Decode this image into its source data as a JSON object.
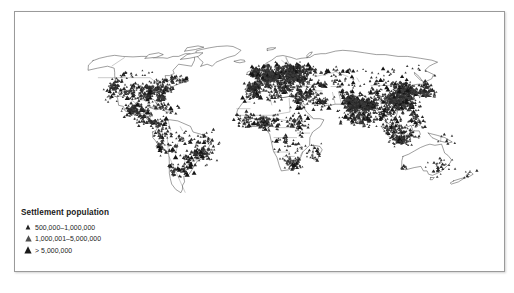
{
  "figure": {
    "background_color": "#ffffff",
    "border_color": "#9a9a9a",
    "land_outline_color": "#1a1a1a",
    "marker_color": "#222222"
  },
  "map": {
    "name": "world-settlement-population-map",
    "projection": "robinson",
    "land_fill": "#ffffff",
    "graticule": false
  },
  "legend": {
    "title": "Settlement population",
    "items": [
      {
        "label": "500,000–1,000,000",
        "marker": "triangle-small",
        "size": 3.0
      },
      {
        "label": "1,000,001–5,000,000",
        "marker": "triangle-medium",
        "size": 4.1
      },
      {
        "label": "> 5,000,000",
        "marker": "triangle-large",
        "size": 5.2
      }
    ]
  },
  "chart_data": {
    "type": "scatter",
    "title": "Settlement population",
    "xlabel": "",
    "ylabel": "",
    "grid": false,
    "legend_position": "bottom-left",
    "categories": [
      "500,000–1,000,000",
      "1,000,001–5,000,000",
      "> 5,000,000"
    ],
    "region_density": [
      {
        "region": "Europe",
        "density": "very-high"
      },
      {
        "region": "South Asia",
        "density": "very-high"
      },
      {
        "region": "East Asia",
        "density": "very-high"
      },
      {
        "region": "Southeast Asia",
        "density": "high"
      },
      {
        "region": "Japan",
        "density": "high"
      },
      {
        "region": "United States",
        "density": "high"
      },
      {
        "region": "Mexico and Central America",
        "density": "high"
      },
      {
        "region": "Brazil and Andes",
        "density": "moderate"
      },
      {
        "region": "West Africa",
        "density": "moderate"
      },
      {
        "region": "Southern Africa",
        "density": "moderate"
      },
      {
        "region": "Middle East",
        "density": "moderate"
      },
      {
        "region": "Australia",
        "density": "low"
      },
      {
        "region": "Canada interior",
        "density": "low"
      },
      {
        "region": "Sahara",
        "density": "very-low"
      },
      {
        "region": "Siberia",
        "density": "very-low"
      }
    ]
  }
}
